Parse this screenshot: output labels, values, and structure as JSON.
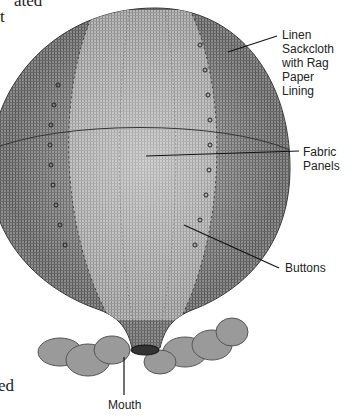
{
  "clipped_text": {
    "top_line1": "ated",
    "top_line2": "t",
    "bottom": "ed"
  },
  "labels": {
    "lining": [
      "Linen Sackcloth",
      "with Rag Paper",
      "Lining"
    ],
    "panels": [
      "Fabric",
      "Panels"
    ],
    "buttons": "Buttons",
    "mouth": "Mouth"
  }
}
